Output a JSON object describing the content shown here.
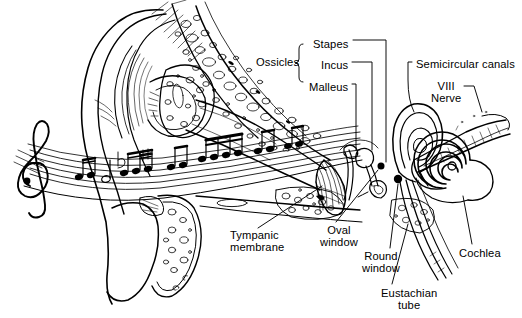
{
  "figure": {
    "type": "anatomical-line-diagram",
    "background_color": "#ffffff",
    "ink_color": "#000000",
    "width": 522,
    "height": 318
  },
  "labels": [
    {
      "id": "ossicles",
      "text": "Ossicles",
      "x": 256,
      "y": 62,
      "align": "left"
    },
    {
      "id": "stapes",
      "text": "Stapes",
      "x": 313,
      "y": 44,
      "align": "left"
    },
    {
      "id": "incus",
      "text": "Incus",
      "x": 321,
      "y": 65,
      "align": "left"
    },
    {
      "id": "malleus",
      "text": "Malleus",
      "x": 309,
      "y": 87,
      "align": "left"
    },
    {
      "id": "semicircular-canals",
      "text": "Semicircular canals",
      "x": 416,
      "y": 64,
      "align": "left"
    },
    {
      "id": "viii-nerve",
      "text": "VIII\nNerve",
      "x": 431,
      "y": 86,
      "align": "left"
    },
    {
      "id": "tympanic-membrane",
      "text": "Tympanic\nmembrane",
      "x": 230,
      "y": 231,
      "align": "left"
    },
    {
      "id": "oval-window",
      "text": "Oval\nwindow",
      "x": 323,
      "y": 226,
      "align": "left"
    },
    {
      "id": "round-window",
      "text": "Round\nwindow",
      "x": 362,
      "y": 252,
      "align": "left"
    },
    {
      "id": "eustachian-tube",
      "text": "Eustachian\ntube",
      "x": 383,
      "y": 289,
      "align": "left"
    },
    {
      "id": "cochlea",
      "text": "Cochlea",
      "x": 461,
      "y": 249,
      "align": "left"
    }
  ],
  "structures": [
    {
      "id": "pinna",
      "name": "Pinna (auricle / outer ear)"
    },
    {
      "id": "ear-canal",
      "name": "External auditory canal"
    },
    {
      "id": "mastoid-bone",
      "name": "Mastoid air cells (stippled bone)"
    },
    {
      "id": "tympanic-membrane",
      "name": "Tympanic membrane (eardrum)"
    },
    {
      "id": "malleus",
      "name": "Malleus (hammer)"
    },
    {
      "id": "incus",
      "name": "Incus (anvil)"
    },
    {
      "id": "stapes",
      "name": "Stapes (stirrup)"
    },
    {
      "id": "oval-window",
      "name": "Oval window"
    },
    {
      "id": "round-window",
      "name": "Round window"
    },
    {
      "id": "semicircular-canals",
      "name": "Semicircular canals"
    },
    {
      "id": "cochlea",
      "name": "Cochlea (spiral)"
    },
    {
      "id": "viii-nerve",
      "name": "Vestibulocochlear nerve (CN VIII)"
    },
    {
      "id": "eustachian-tube",
      "name": "Eustachian tube"
    },
    {
      "id": "music-staff",
      "name": "Wavy musical staff with treble clef and notes"
    }
  ]
}
